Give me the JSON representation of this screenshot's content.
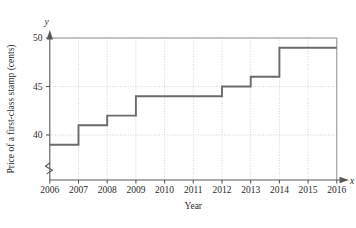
{
  "chart_data": {
    "type": "line",
    "subtype": "step",
    "title": "",
    "subtitle": "",
    "xlabel": "Year",
    "ylabel": "Price of a first-class stamp (cents)",
    "x_axis_name": "x",
    "y_axis_name": "y",
    "xlim": [
      2006,
      2016
    ],
    "ylim": [
      38,
      50
    ],
    "y_axis_broken": true,
    "y_break_symbol": "zigzag",
    "grid": true,
    "grid_style": "dotted",
    "legend": "none",
    "xticks": [
      "2006",
      "2007",
      "2008",
      "2009",
      "2010",
      "2011",
      "2012",
      "2013",
      "2014",
      "2015",
      "2016"
    ],
    "yticks": [
      "40",
      "45",
      "50"
    ],
    "ytick_values": [
      40,
      45,
      50
    ],
    "xtick_values": [
      2006,
      2007,
      2008,
      2009,
      2010,
      2011,
      2012,
      2013,
      2014,
      2015,
      2016
    ],
    "steps": [
      {
        "x_start": 2006,
        "x_end": 2007,
        "value": 39
      },
      {
        "x_start": 2007,
        "x_end": 2008,
        "value": 41
      },
      {
        "x_start": 2008,
        "x_end": 2009,
        "value": 42
      },
      {
        "x_start": 2009,
        "x_end": 2012,
        "value": 44
      },
      {
        "x_start": 2012,
        "x_end": 2013,
        "value": 45
      },
      {
        "x_start": 2013,
        "x_end": 2014,
        "value": 46
      },
      {
        "x_start": 2014,
        "x_end": 2016,
        "value": 49
      }
    ],
    "x": [
      2006,
      2007,
      2008,
      2009,
      2010,
      2011,
      2012,
      2013,
      2014,
      2015,
      2016
    ],
    "values": [
      39,
      41,
      42,
      44,
      44,
      44,
      45,
      46,
      49,
      49,
      49
    ],
    "series": [
      {
        "name": "Price of a first-class stamp (cents)",
        "values": [
          39,
          41,
          42,
          44,
          44,
          44,
          45,
          46,
          49,
          49,
          49
        ]
      }
    ],
    "colors": {
      "data_line": "#6b6b6b",
      "axis": "#595959",
      "grid": "#c9c9c9",
      "text": "#2b2b2b",
      "background": "#ffffff"
    }
  }
}
